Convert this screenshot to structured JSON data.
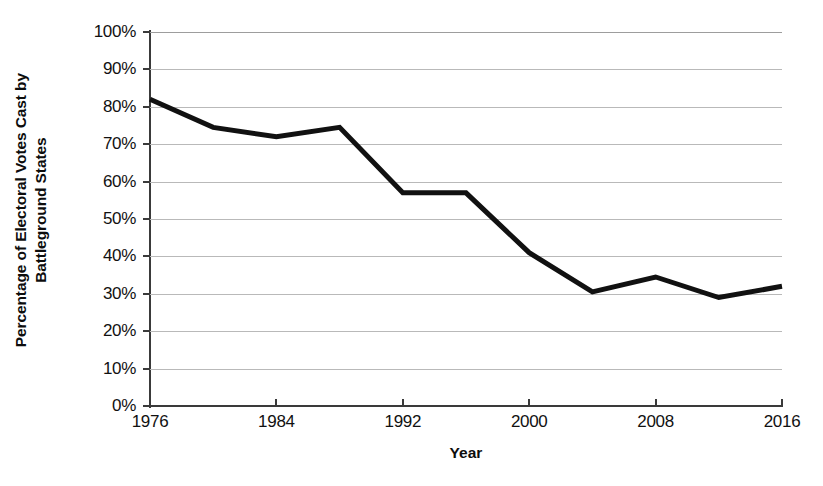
{
  "chart_data": {
    "type": "line",
    "title": "",
    "subtitle": "",
    "xlabel": "Year",
    "ylabel": "Percentage of Electoral Votes Cast by Battleground States",
    "ylabel_lines": [
      "Percentage of Electoral Votes Cast by",
      "Battleground States"
    ],
    "x": [
      1976,
      1980,
      1984,
      1988,
      1992,
      1996,
      2000,
      2004,
      2008,
      2012,
      2016
    ],
    "values": [
      82,
      74.5,
      72,
      74.5,
      57,
      57,
      41,
      30.5,
      34.5,
      29,
      32
    ],
    "series": [
      {
        "name": "Percentage of Electoral Votes Cast by Battleground States",
        "values": [
          82,
          74.5,
          72,
          74.5,
          57,
          57,
          41,
          30.5,
          34.5,
          29,
          32
        ]
      }
    ],
    "xlim": [
      1976,
      2016
    ],
    "ylim": [
      0,
      100
    ],
    "xticks": [
      1976,
      1984,
      1992,
      2000,
      2008,
      2016
    ],
    "xtick_labels": [
      "1976",
      "1984",
      "1992",
      "2000",
      "2008",
      "2016"
    ],
    "yticks": [
      0,
      10,
      20,
      30,
      40,
      50,
      60,
      70,
      80,
      90,
      100
    ],
    "ytick_labels": [
      "0%",
      "10%",
      "20%",
      "30%",
      "40%",
      "50%",
      "60%",
      "70%",
      "80%",
      "90%",
      "100%"
    ],
    "grid": true,
    "grid_axis": "y",
    "legend": false,
    "legend_position": "none",
    "line_color": "#111111",
    "line_width": 5,
    "grid_color": "#b9b9b9",
    "axis_color": "#3a3a3a",
    "background_color": "#ffffff",
    "markers": false
  }
}
